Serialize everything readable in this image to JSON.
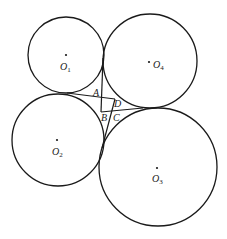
{
  "figure": {
    "stroke_color": "#1a1a1a",
    "background": "#ffffff",
    "circles": [
      {
        "id": "O1",
        "label": "O",
        "subscript": "1",
        "cx": 66,
        "cy": 55,
        "r": 38,
        "label_x": 60,
        "label_y": 70,
        "dot_x": 66,
        "dot_y": 55
      },
      {
        "id": "O4",
        "label": "O",
        "subscript": "4",
        "cx": 150,
        "cy": 61,
        "r": 47,
        "label_x": 153,
        "label_y": 68,
        "dot_x": 149,
        "dot_y": 62
      },
      {
        "id": "O2",
        "label": "O",
        "subscript": "2",
        "cx": 58,
        "cy": 140,
        "r": 46,
        "label_x": 52,
        "label_y": 155,
        "dot_x": 57,
        "dot_y": 140
      },
      {
        "id": "O3",
        "label": "O",
        "subscript": "3",
        "cx": 158,
        "cy": 167,
        "r": 59,
        "label_x": 152,
        "label_y": 182,
        "dot_x": 157,
        "dot_y": 168
      }
    ],
    "tangent_lines": [
      {
        "from": "O1-O2 tangency",
        "x1": 67,
        "y1": 93,
        "x2": 115,
        "y2": 99
      },
      {
        "from": "O1-O4 tangency",
        "x1": 103,
        "y1": 58,
        "x2": 101,
        "y2": 112
      },
      {
        "from": "O4-O3 tangency",
        "x1": 143,
        "y1": 108,
        "x2": 101,
        "y2": 112
      },
      {
        "from": "O2-O3 tangency",
        "x1": 102,
        "y1": 148,
        "x2": 115,
        "y2": 99
      }
    ],
    "points": [
      {
        "label": "A",
        "x": 93,
        "y": 96
      },
      {
        "label": "D",
        "x": 114,
        "y": 107
      },
      {
        "label": "B",
        "x": 101,
        "y": 121
      },
      {
        "label": "C",
        "x": 113,
        "y": 121
      }
    ]
  }
}
